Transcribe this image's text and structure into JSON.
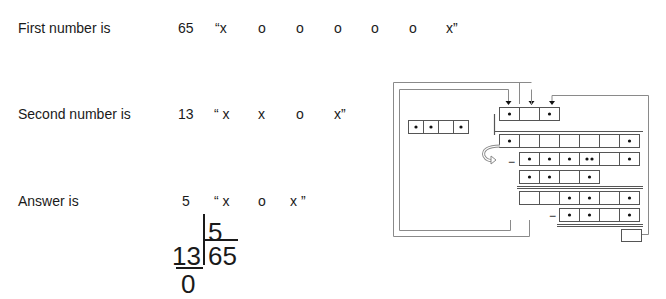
{
  "rows": [
    {
      "label": "First number is",
      "number": "65",
      "tokens": [
        "“x",
        "o",
        "o",
        "o",
        "o",
        "o",
        "x”"
      ]
    },
    {
      "label": "Second number is",
      "number": "13",
      "tokens": [
        "“ x",
        "x",
        "o",
        "x”"
      ]
    },
    {
      "label": "Answer is",
      "number": "5",
      "tokens": [
        "“ x",
        "o",
        "x ”"
      ]
    }
  ],
  "division": {
    "quotient": "5",
    "divisor": "13",
    "dividend": "65",
    "remainder": "0"
  },
  "diagram": {
    "stroke_color": "#8a8a8a",
    "cell_stroke_color": "#555555",
    "dot_color": "#111111",
    "minus_sign": "−",
    "quotient_row": [
      true,
      false,
      true
    ],
    "divisor_row": [
      true,
      true,
      false,
      true
    ],
    "dividend_row": [
      true,
      false,
      false,
      false,
      false,
      false,
      true
    ],
    "subtract_row_1": [
      true,
      true,
      true,
      "double",
      false,
      true
    ],
    "subtract_row_2": [
      true,
      true,
      false,
      true
    ],
    "result_row": [
      false,
      false,
      true,
      true,
      false,
      true
    ],
    "subtract_row_3": [
      true,
      true,
      false,
      true
    ],
    "remainder_box": [
      false
    ]
  }
}
